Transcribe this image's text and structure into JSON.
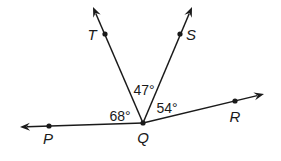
{
  "diagram": {
    "type": "angle-diagram",
    "vertex": {
      "name": "Q",
      "label": "Q",
      "x": 143,
      "y": 123,
      "label_x": 143,
      "label_y": 143
    },
    "rays": [
      {
        "name": "ray-QP",
        "label": "P",
        "dot_x": 49,
        "dot_y": 126,
        "tip_x": 20,
        "tip_y": 127,
        "label_x": 48,
        "label_y": 144
      },
      {
        "name": "ray-QT",
        "label": "T",
        "dot_x": 105,
        "dot_y": 34,
        "tip_x": 93,
        "tip_y": 7,
        "label_x": 92,
        "label_y": 40
      },
      {
        "name": "ray-QS",
        "label": "S",
        "dot_x": 180,
        "dot_y": 34,
        "tip_x": 192,
        "tip_y": 7,
        "label_x": 191,
        "label_y": 40
      },
      {
        "name": "ray-QR",
        "label": "R",
        "dot_x": 235,
        "dot_y": 101,
        "tip_x": 264,
        "tip_y": 94,
        "label_x": 235,
        "label_y": 122
      }
    ],
    "angles": [
      {
        "name": "angle-PQT",
        "label": "68°",
        "x": 120,
        "y": 121
      },
      {
        "name": "angle-TQS",
        "label": "47°",
        "x": 144,
        "y": 95
      },
      {
        "name": "angle-SQR",
        "label": "54°",
        "x": 167,
        "y": 113
      }
    ],
    "color": "#1a1a1a"
  }
}
